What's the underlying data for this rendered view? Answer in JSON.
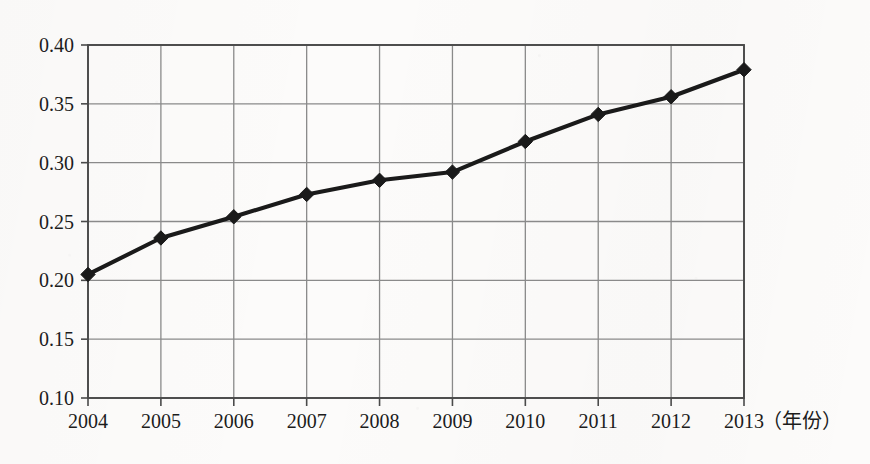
{
  "chart_data": {
    "type": "line",
    "title": "",
    "subtitle": "",
    "xlabel": "（年份）",
    "ylabel": "",
    "categories": [
      "2004",
      "2005",
      "2006",
      "2007",
      "2008",
      "2009",
      "2010",
      "2011",
      "2012",
      "2013"
    ],
    "x": [
      2004,
      2005,
      2006,
      2007,
      2008,
      2009,
      2010,
      2011,
      2012,
      2013
    ],
    "values": [
      0.205,
      0.236,
      0.254,
      0.273,
      0.285,
      0.292,
      0.318,
      0.341,
      0.356,
      0.379
    ],
    "series": [
      {
        "name": "",
        "values": [
          0.205,
          0.236,
          0.254,
          0.273,
          0.285,
          0.292,
          0.318,
          0.341,
          0.356,
          0.379
        ]
      }
    ],
    "ylim": [
      0.1,
      0.4
    ],
    "yticks": [
      0.1,
      0.15,
      0.2,
      0.25,
      0.3,
      0.35,
      0.4
    ],
    "ytick_labels": [
      "0.10",
      "0.15",
      "0.20",
      "0.25",
      "0.30",
      "0.35",
      "0.40"
    ],
    "xtick_labels": [
      "2004",
      "2005",
      "2006",
      "2007",
      "2008",
      "2009",
      "2010",
      "2011",
      "2012",
      "2013"
    ],
    "grid": true,
    "grid_x": true,
    "grid_y": true,
    "legend": false,
    "legend_position": "none",
    "marker": "diamond",
    "line_color": "#1a1a1a",
    "marker_color": "#1a1a1a",
    "grid_color": "#8a8a8a",
    "axis_color": "#4a4a4a",
    "background_color": "#fcfbfa",
    "annotations": []
  },
  "axis": {
    "x_unit_label": "（年份）"
  }
}
